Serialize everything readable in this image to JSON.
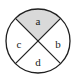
{
  "figure": {
    "type": "circle-divided-into-four-sectors",
    "canvas": {
      "width": 76,
      "height": 82
    },
    "circle": {
      "center_x": 38,
      "center_y": 41,
      "radius": 32,
      "stroke_color": "#1f1f1f",
      "stroke_width": 1.2,
      "fill_color": "#ffffff"
    },
    "chords": [
      {
        "name": "chord-nw-se",
        "x1": 15.4,
        "y1": 18.4,
        "x2": 60.6,
        "y2": 63.6
      },
      {
        "name": "chord-ne-sw",
        "x1": 60.6,
        "y1": 18.4,
        "x2": 15.4,
        "y2": 63.6
      }
    ],
    "shaded_color": "#d9d9d9",
    "unshaded_color": "#ffffff",
    "sectors": [
      {
        "id": "a",
        "label": "a",
        "position": "top",
        "shaded": true,
        "fill": "#d9d9d9",
        "label_x": 38,
        "label_y": 22
      },
      {
        "id": "b",
        "label": "b",
        "position": "right",
        "shaded": false,
        "fill": "#ffffff",
        "label_x": 58,
        "label_y": 45
      },
      {
        "id": "c",
        "label": "c",
        "position": "left",
        "shaded": false,
        "fill": "#ffffff",
        "label_x": 19,
        "label_y": 45
      },
      {
        "id": "d",
        "label": "d",
        "position": "bottom",
        "shaded": false,
        "fill": "#ffffff",
        "label_x": 38,
        "label_y": 63
      }
    ]
  }
}
